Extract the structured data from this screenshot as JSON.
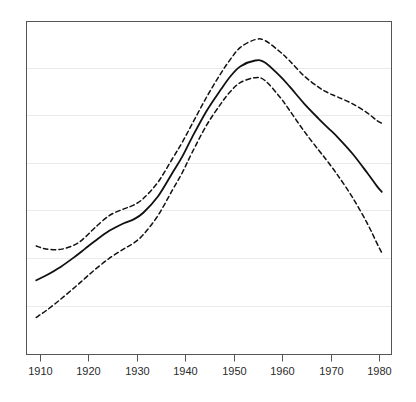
{
  "figure": {
    "background_color": "#ffffff",
    "frame_color": "#555555",
    "grid_color": "#ebebeb",
    "line_color": "#111111"
  },
  "chart_data": {
    "type": "line",
    "title": "",
    "subtitle": "",
    "xlabel": "",
    "ylabel": "",
    "xlim": [
      1908,
      1983
    ],
    "ylim": [
      0,
      7
    ],
    "grid": true,
    "grid_axis": "y",
    "legend": "none",
    "xticks": [
      1910,
      1920,
      1930,
      1940,
      1950,
      1960,
      1970,
      1980
    ],
    "xtick_labels": [
      "1910",
      "1920",
      "1930",
      "1940",
      "1950",
      "1960",
      "1970",
      "1980"
    ],
    "yticks": [],
    "ytick_labels": [],
    "x": [
      1910,
      1912,
      1915,
      1918,
      1920,
      1922,
      1925,
      1928,
      1930,
      1932,
      1935,
      1938,
      1940,
      1942,
      1945,
      1948,
      1950,
      1952,
      1955,
      1957,
      1960,
      1962,
      1965,
      1968,
      1970,
      1972,
      1975,
      1978,
      1980,
      1981
    ],
    "series": [
      {
        "name": "upper-confidence-band",
        "style": "dashed",
        "values": [
          2.28,
          2.22,
          2.21,
          2.31,
          2.46,
          2.66,
          2.92,
          3.06,
          3.14,
          3.28,
          3.62,
          4.12,
          4.46,
          4.84,
          5.41,
          5.92,
          6.22,
          6.46,
          6.62,
          6.6,
          6.37,
          6.18,
          5.86,
          5.62,
          5.5,
          5.41,
          5.27,
          5.08,
          4.92,
          4.86
        ]
      },
      {
        "name": "mean-estimate",
        "style": "solid",
        "values": [
          1.56,
          1.66,
          1.84,
          2.06,
          2.22,
          2.38,
          2.6,
          2.76,
          2.84,
          2.98,
          3.32,
          3.82,
          4.16,
          4.56,
          5.12,
          5.58,
          5.86,
          6.06,
          6.18,
          6.14,
          5.86,
          5.64,
          5.28,
          4.96,
          4.76,
          4.56,
          4.22,
          3.82,
          3.54,
          3.42
        ]
      },
      {
        "name": "lower-confidence-band",
        "style": "dashed",
        "values": [
          0.78,
          0.92,
          1.16,
          1.42,
          1.6,
          1.78,
          2.02,
          2.22,
          2.34,
          2.52,
          2.92,
          3.46,
          3.82,
          4.24,
          4.82,
          5.28,
          5.54,
          5.72,
          5.82,
          5.76,
          5.42,
          5.14,
          4.7,
          4.3,
          4.04,
          3.76,
          3.3,
          2.76,
          2.34,
          2.14
        ]
      }
    ]
  },
  "caption": {
    "text": ""
  }
}
